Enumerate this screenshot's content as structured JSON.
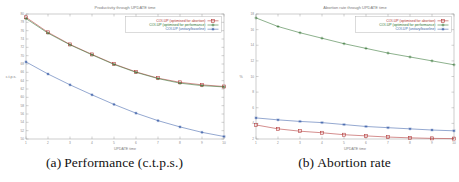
{
  "figure": {
    "background": "#ffffff",
    "subfigures": [
      {
        "caption_label": "(a)",
        "caption_text": "Performance (c.t.p.s.)"
      },
      {
        "caption_label": "(b)",
        "caption_text": "Abortion rate"
      }
    ]
  },
  "chart_data": [
    {
      "type": "line",
      "title": "Productivity through UPDATE time",
      "xlabel": "UPDATE time",
      "ylabel": "c.t.p.s.",
      "x": [
        1,
        2,
        3,
        4,
        5,
        6,
        7,
        8,
        9,
        10
      ],
      "xlim": [
        1,
        10
      ],
      "ylim": [
        50,
        80
      ],
      "xticks": [
        "1",
        "2",
        "3",
        "4",
        "5",
        "6",
        "7",
        "8",
        "9",
        "10"
      ],
      "yticks": [
        "50",
        "52",
        "54",
        "56",
        "58",
        "60",
        "62",
        "64",
        "66",
        "68",
        "70",
        "72",
        "74",
        "76",
        "78",
        "80"
      ],
      "grid": false,
      "legend_position": "top-right",
      "series": [
        {
          "name": "COI-UP (optimised for abortion)",
          "color": "#b03030",
          "marker": "square",
          "values": [
            79.2,
            75.6,
            72.7,
            70.3,
            68.0,
            66.1,
            64.6,
            63.6,
            63.0,
            62.6
          ]
        },
        {
          "name": "COI-UP (optimised for performance)",
          "color": "#2e6f2e",
          "marker": "plus",
          "values": [
            78.9,
            75.4,
            72.6,
            70.2,
            67.9,
            66.0,
            64.5,
            63.4,
            62.8,
            62.5
          ]
        },
        {
          "name": "COI-UP (unitary/baseline)",
          "color": "#3b5fa8",
          "marker": "star",
          "values": [
            68.5,
            65.6,
            63.0,
            60.6,
            58.3,
            56.2,
            54.4,
            52.9,
            51.6,
            50.6
          ]
        }
      ]
    },
    {
      "type": "line",
      "title": "Abortion rate through UPDATE time",
      "xlabel": "UPDATE time",
      "ylabel": "%",
      "x": [
        1,
        2,
        3,
        4,
        5,
        6,
        7,
        8,
        9,
        10
      ],
      "xlim": [
        1,
        10
      ],
      "ylim": [
        2,
        18
      ],
      "xticks": [
        "1",
        "2",
        "3",
        "4",
        "5",
        "6",
        "7",
        "8",
        "9",
        "10"
      ],
      "yticks": [
        "2",
        "4",
        "6",
        "8",
        "10",
        "12",
        "14",
        "16",
        "18"
      ],
      "grid": false,
      "legend_position": "top-right",
      "series": [
        {
          "name": "COI-UP (optimised for abortion)",
          "color": "#b03030",
          "marker": "square",
          "values": [
            3.8,
            3.3,
            3.0,
            2.8,
            2.55,
            2.4,
            2.25,
            2.15,
            2.08,
            2.05
          ]
        },
        {
          "name": "COI-UP (optimised for performance)",
          "color": "#2e6f2e",
          "marker": "plus",
          "values": [
            17.5,
            16.4,
            15.6,
            14.9,
            14.2,
            13.6,
            13.0,
            12.5,
            12.0,
            11.5
          ]
        },
        {
          "name": "COI-UP (unitary/baseline)",
          "color": "#3b5fa8",
          "marker": "star",
          "values": [
            4.7,
            4.45,
            4.25,
            4.1,
            3.85,
            3.6,
            3.45,
            3.3,
            3.15,
            3.05
          ]
        }
      ]
    }
  ]
}
